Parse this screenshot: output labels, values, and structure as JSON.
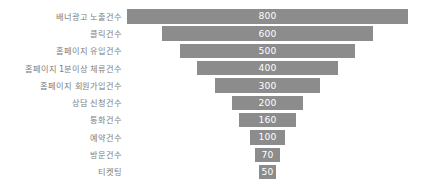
{
  "chart_data": {
    "type": "bar",
    "subtype": "funnel",
    "title": "",
    "xlabel": "",
    "ylabel": "",
    "orientation": "horizontal-centered",
    "grid": false,
    "legend": null,
    "legend_position": "none",
    "axis_visible": false,
    "xlim": [
      0,
      800
    ],
    "categories": [
      "배너광고 노출건수",
      "클릭건수",
      "홈페이지 유입건수",
      "홈페이지 1분이상 체류건수",
      "홈페이지 회원가입건수",
      "상담 신청건수",
      "통화건수",
      "예약건수",
      "방문건수",
      "티켓팅"
    ],
    "values": [
      800,
      600,
      500,
      400,
      300,
      200,
      160,
      100,
      70,
      50
    ],
    "value_labels": [
      "800",
      "600",
      "500",
      "400",
      "300",
      "200",
      "160",
      "100",
      "70",
      "50"
    ],
    "colors": {
      "bar": "#8c8c8c",
      "value_text": "#ffffff",
      "label_text": "#7d7d7d",
      "background": "#ffffff"
    }
  }
}
